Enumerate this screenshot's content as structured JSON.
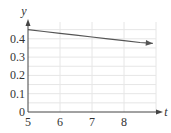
{
  "chart_data": {
    "type": "line",
    "title": "",
    "xlabel": "t",
    "ylabel": "y",
    "xlim": [
      5,
      9
    ],
    "ylim": [
      0,
      0.5
    ],
    "x_ticks": [
      "5",
      "6",
      "7",
      "8"
    ],
    "y_ticks": [
      "0",
      "0.1",
      "0.2",
      "0.3",
      "0.4"
    ],
    "grid": true,
    "legend": null,
    "series": [
      {
        "name": "y(t)",
        "x": [
          5,
          5.5,
          6,
          6.5,
          7,
          7.5,
          8,
          8.5,
          8.9
        ],
        "values": [
          0.45,
          0.44,
          0.43,
          0.42,
          0.41,
          0.4,
          0.39,
          0.38,
          0.375
        ]
      }
    ]
  },
  "axes": {
    "x_label": "t",
    "y_label": "y",
    "x_tick_labels": [
      "5",
      "6",
      "7",
      "8"
    ],
    "y_tick_labels": [
      "0",
      "0.1",
      "0.2",
      "0.3",
      "0.4"
    ]
  },
  "colors": {
    "axis": "#444444",
    "grid": "#e6e6e6",
    "curve": "#555555"
  }
}
